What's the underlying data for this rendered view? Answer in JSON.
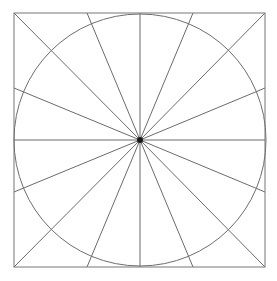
{
  "figure": {
    "type": "geometric-diagram",
    "canvas": {
      "width": 277,
      "height": 281,
      "background": "#ffffff"
    },
    "colors": {
      "background": "#ffffff",
      "stroke": "#6b6b6b",
      "square_stroke": "#767676",
      "circle_stroke": "#6e6e6e",
      "spoke_stroke": "#6b6b6b",
      "center_dot": "#1a1a1a"
    },
    "stroke_widths": {
      "square": 1,
      "circle": 1,
      "spoke": 1
    },
    "square": {
      "label": "bounding-square",
      "left": 14,
      "top": 13,
      "right": 265,
      "bottom": 267,
      "width": 251,
      "height": 254
    },
    "circle": {
      "label": "inscribed-circle",
      "cx": 140,
      "cy": 140,
      "r": 126
    },
    "center": {
      "label": "center-point",
      "x": 140,
      "y": 140,
      "dot_radius": 3
    },
    "spoke_count": 16,
    "spoke_angle_step_degrees": 22.5,
    "spokes": [
      {
        "name": "spoke-e",
        "angle": 0,
        "x1": 140,
        "y1": 140,
        "x2": 265,
        "y2": 140
      },
      {
        "name": "spoke-ene",
        "angle": 22.5,
        "x1": 140,
        "y1": 140,
        "x2": 265,
        "y2": 88
      },
      {
        "name": "spoke-ne",
        "angle": 45,
        "x1": 140,
        "y1": 140,
        "x2": 265,
        "y2": 13
      },
      {
        "name": "spoke-nne",
        "angle": 67.5,
        "x1": 140,
        "y1": 140,
        "x2": 193,
        "y2": 13
      },
      {
        "name": "spoke-n",
        "angle": 90,
        "x1": 140,
        "y1": 140,
        "x2": 140,
        "y2": 13
      },
      {
        "name": "spoke-nnw",
        "angle": 112.5,
        "x1": 140,
        "y1": 140,
        "x2": 87,
        "y2": 13
      },
      {
        "name": "spoke-nw",
        "angle": 135,
        "x1": 140,
        "y1": 140,
        "x2": 14,
        "y2": 13
      },
      {
        "name": "spoke-wnw",
        "angle": 157.5,
        "x1": 140,
        "y1": 140,
        "x2": 14,
        "y2": 88
      },
      {
        "name": "spoke-w",
        "angle": 180,
        "x1": 140,
        "y1": 140,
        "x2": 14,
        "y2": 140
      },
      {
        "name": "spoke-wsw",
        "angle": 202.5,
        "x1": 140,
        "y1": 140,
        "x2": 14,
        "y2": 192
      },
      {
        "name": "spoke-sw",
        "angle": 225,
        "x1": 140,
        "y1": 140,
        "x2": 14,
        "y2": 267
      },
      {
        "name": "spoke-ssw",
        "angle": 247.5,
        "x1": 140,
        "y1": 140,
        "x2": 87,
        "y2": 267
      },
      {
        "name": "spoke-s",
        "angle": 270,
        "x1": 140,
        "y1": 140,
        "x2": 140,
        "y2": 267
      },
      {
        "name": "spoke-sse",
        "angle": 292.5,
        "x1": 140,
        "y1": 140,
        "x2": 193,
        "y2": 267
      },
      {
        "name": "spoke-se",
        "angle": 315,
        "x1": 140,
        "y1": 140,
        "x2": 265,
        "y2": 267
      },
      {
        "name": "spoke-ese",
        "angle": 337.5,
        "x1": 140,
        "y1": 140,
        "x2": 265,
        "y2": 192
      }
    ]
  }
}
